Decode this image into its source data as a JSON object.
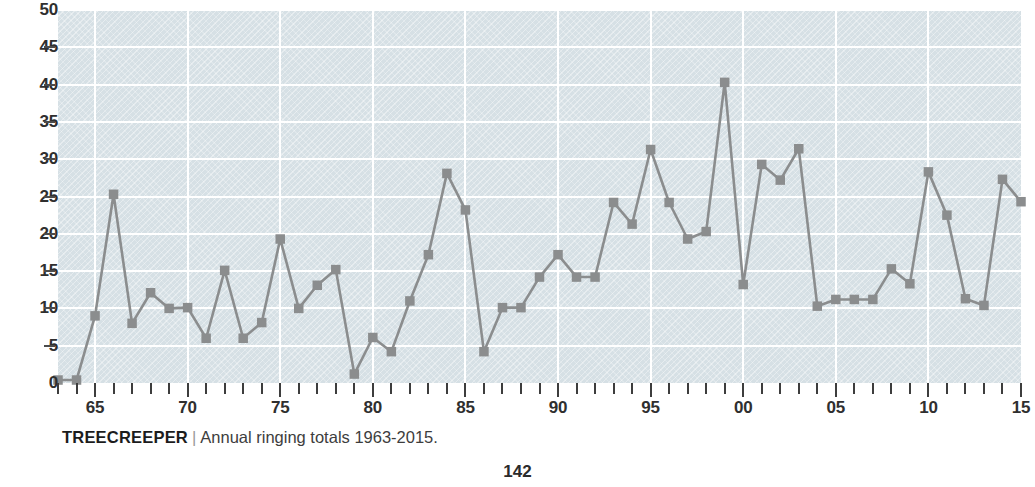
{
  "page": {
    "number": "142"
  },
  "caption": {
    "species": "TREECREEPER",
    "separator": "|",
    "text": "Annual ringing totals 1963-2015."
  },
  "colors": {
    "plot_background": "#d6e0e5",
    "gridline": "#ffffff",
    "series_line": "#8b8d8e",
    "series_marker": "#8b8d8e",
    "axis_text": "#2f2f2f",
    "tick": "#3d3d3d",
    "page_background": "#ffffff"
  },
  "chart_data": {
    "type": "line",
    "xlabel": "",
    "ylabel": "",
    "grid": true,
    "legend": "none",
    "ylim": [
      0,
      50
    ],
    "yticks": [
      0,
      5,
      10,
      15,
      20,
      25,
      30,
      35,
      40,
      45,
      50
    ],
    "ytick_labels": [
      "0",
      "5",
      "10",
      "15",
      "20",
      "25",
      "30",
      "35",
      "40",
      "45",
      "50"
    ],
    "xlim": [
      1963,
      2015
    ],
    "xtick_labels": [
      "65",
      "70",
      "75",
      "80",
      "85",
      "90",
      "95",
      "00",
      "05",
      "10",
      "15"
    ],
    "xtick_years": [
      1965,
      1970,
      1975,
      1980,
      1985,
      1990,
      1995,
      2000,
      2005,
      2010,
      2015
    ],
    "x": [
      1963,
      1964,
      1965,
      1966,
      1967,
      1968,
      1969,
      1970,
      1971,
      1972,
      1973,
      1974,
      1975,
      1976,
      1977,
      1978,
      1979,
      1980,
      1981,
      1982,
      1983,
      1984,
      1985,
      1986,
      1987,
      1988,
      1989,
      1990,
      1991,
      1992,
      1993,
      1994,
      1995,
      1996,
      1997,
      1998,
      1999,
      2000,
      2001,
      2002,
      2003,
      2004,
      2005,
      2006,
      2007,
      2008,
      2009,
      2010,
      2011,
      2012,
      2013,
      2014,
      2015
    ],
    "series": [
      {
        "name": "Annual ringing total",
        "values": [
          0.4,
          0.4,
          9.0,
          25.3,
          8.0,
          12.1,
          10.0,
          10.1,
          6.0,
          15.1,
          6.0,
          8.1,
          19.3,
          10.0,
          13.1,
          15.2,
          1.2,
          6.1,
          4.2,
          11.0,
          17.2,
          28.1,
          23.2,
          4.2,
          10.1,
          10.1,
          14.2,
          17.2,
          14.2,
          14.2,
          24.2,
          21.3,
          31.3,
          24.2,
          19.3,
          20.3,
          40.3,
          13.2,
          29.3,
          27.2,
          31.4,
          10.3,
          11.2,
          11.2,
          11.2,
          15.3,
          13.3,
          28.3,
          22.5,
          11.3,
          10.4,
          27.3,
          24.3
        ]
      }
    ]
  }
}
